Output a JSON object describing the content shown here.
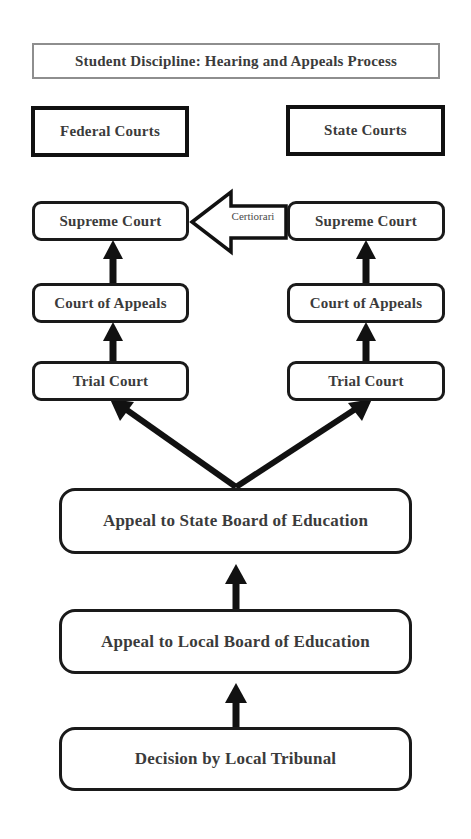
{
  "diagram": {
    "title": "Student Discipline: Hearing and Appeals Process",
    "groups": {
      "federal": "Federal Courts",
      "state": "State Courts"
    },
    "federal_column": {
      "supreme_court": "Supreme Court",
      "court_of_appeals": "Court of Appeals",
      "trial_court": "Trial Court"
    },
    "state_column": {
      "supreme_court": "Supreme Court",
      "court_of_appeals": "Court of Appeals",
      "trial_court": "Trial Court"
    },
    "cross_link": {
      "label": "Certiorari",
      "direction": "state-supreme-court-to-federal-supreme-court"
    },
    "process_steps": [
      "Appeal to State Board of Education",
      "Appeal to Local Board of Education",
      "Decision by Local Tribunal"
    ],
    "colors": {
      "stroke": "#1a1a1a",
      "title_border": "#8e8e8e",
      "text": "#3b3b3b",
      "background": "#ffffff"
    }
  }
}
